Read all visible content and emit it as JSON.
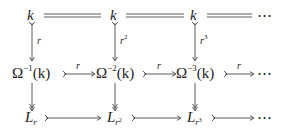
{
  "diagram": {
    "type": "commutative-diagram",
    "rows": [
      {
        "name": "top-row",
        "nodes": [
          {
            "base": "k",
            "sup": "",
            "arg": ""
          },
          {
            "base": "k",
            "sup": "",
            "arg": ""
          },
          {
            "base": "k",
            "sup": "",
            "arg": ""
          }
        ],
        "trailing": "⋯",
        "arrow_style": "equality"
      },
      {
        "name": "middle-row",
        "nodes": [
          {
            "base": "Ω",
            "sup": "−1",
            "arg": "(k)"
          },
          {
            "base": "Ω",
            "sup": "−2",
            "arg": "(k)"
          },
          {
            "base": "Ω",
            "sup": "−3",
            "arg": "(k)"
          }
        ],
        "trailing": "⋯",
        "arrow_style": "monomorphism",
        "arrow_labels": [
          "r",
          "r",
          "r"
        ]
      },
      {
        "name": "bottom-row",
        "nodes": [
          {
            "base": "L",
            "sub": "r",
            "subsup": ""
          },
          {
            "base": "L",
            "sub": "r",
            "subsup": "2"
          },
          {
            "base": "L",
            "sub": "r",
            "subsup": "3"
          }
        ],
        "trailing": "⋯",
        "arrow_style": "monomorphism"
      }
    ],
    "vertical_upper": {
      "arrow_style": "monomorphism",
      "labels": [
        {
          "base": "r",
          "sup": ""
        },
        {
          "base": "r",
          "sup": "2"
        },
        {
          "base": "r",
          "sup": "3"
        }
      ]
    },
    "vertical_lower": {
      "arrow_style": "epimorphism",
      "labels": []
    }
  }
}
